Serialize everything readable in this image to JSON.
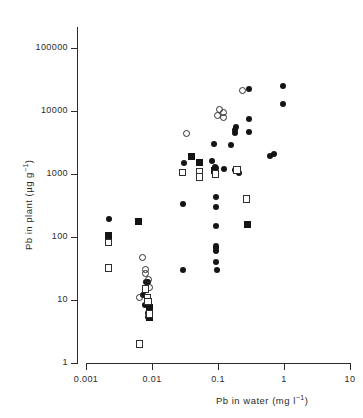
{
  "chart_data": {
    "type": "scatter",
    "title": "",
    "xlabel": "Pb in water (mg l-1)",
    "ylabel": "Pb in plant (µg g-1)",
    "xscale": "log",
    "yscale": "log",
    "xlim": [
      0.001,
      10
    ],
    "ylim": [
      1,
      100000
    ],
    "grid": false,
    "legend": "none",
    "xticks": [
      "0.001",
      "0.01",
      "0.1",
      "1",
      "10"
    ],
    "xtick_values": [
      0.001,
      0.01,
      0.1,
      1,
      10
    ],
    "yticks": [
      "1",
      "10",
      "100",
      "1000",
      "10000",
      "100000"
    ],
    "ytick_values": [
      1,
      10,
      100,
      1000,
      10000,
      100000
    ],
    "series": [
      {
        "name": "filled-circle",
        "marker": "filled-circle",
        "color": "#141414",
        "points": [
          [
            0.0022,
            190
          ],
          [
            0.0072,
            12
          ],
          [
            0.0081,
            19
          ],
          [
            0.0088,
            19
          ],
          [
            0.0079,
            8.4
          ],
          [
            0.0088,
            6.3
          ],
          [
            0.0088,
            5.4
          ],
          [
            0.029,
            330
          ],
          [
            0.031,
            1500
          ],
          [
            0.03,
            30
          ],
          [
            0.082,
            1600
          ],
          [
            0.09,
            1300
          ],
          [
            0.092,
            1250
          ],
          [
            0.088,
            3000
          ],
          [
            0.093,
            430
          ],
          [
            0.093,
            300
          ],
          [
            0.093,
            150
          ],
          [
            0.092,
            72
          ],
          [
            0.093,
            66
          ],
          [
            0.093,
            60
          ],
          [
            0.094,
            40
          ],
          [
            0.095,
            30
          ],
          [
            0.125,
            1200
          ],
          [
            0.155,
            2900
          ],
          [
            0.18,
            1150
          ],
          [
            0.185,
            5500
          ],
          [
            0.183,
            5000
          ],
          [
            0.184,
            4500
          ],
          [
            0.205,
            1050
          ],
          [
            0.3,
            22000
          ],
          [
            0.3,
            7500
          ],
          [
            0.3,
            4700
          ],
          [
            0.62,
            1900
          ],
          [
            0.7,
            2050
          ],
          [
            0.95,
            25000
          ],
          [
            0.98,
            13000
          ]
        ]
      },
      {
        "name": "open-circle",
        "marker": "open-circle",
        "points": [
          [
            0.0072,
            48
          ],
          [
            0.008,
            31
          ],
          [
            0.008,
            26
          ],
          [
            0.009,
            21
          ],
          [
            0.0092,
            16
          ],
          [
            0.0065,
            11
          ],
          [
            0.033,
            4400
          ],
          [
            0.105,
            10500
          ],
          [
            0.12,
            9500
          ],
          [
            0.098,
            8500
          ],
          [
            0.12,
            8000
          ],
          [
            0.235,
            21000
          ]
        ]
      },
      {
        "name": "filled-square",
        "marker": "filled-square",
        "points": [
          [
            0.0022,
            105
          ],
          [
            0.0093,
            7.5
          ],
          [
            0.0093,
            5.2
          ],
          [
            0.0062,
            175
          ],
          [
            0.04,
            1900
          ],
          [
            0.052,
            1500
          ],
          [
            0.09,
            1150
          ],
          [
            0.28,
            160
          ]
        ]
      },
      {
        "name": "open-square",
        "marker": "open-square",
        "points": [
          [
            0.0022,
            82
          ],
          [
            0.0022,
            32
          ],
          [
            0.008,
            15
          ],
          [
            0.0086,
            11
          ],
          [
            0.0087,
            9.5
          ],
          [
            0.0092,
            6.0
          ],
          [
            0.0065,
            2.0
          ],
          [
            0.029,
            1050
          ],
          [
            0.052,
            1100
          ],
          [
            0.052,
            900
          ],
          [
            0.092,
            1000
          ],
          [
            0.193,
            1150
          ],
          [
            0.27,
            400
          ]
        ]
      }
    ]
  },
  "axis_geometry": {
    "x_px_001": 86,
    "x_px_per_decade": 66,
    "y_px_1": 363,
    "y_px_per_decade": 63
  },
  "labels": {
    "y_axis_prefix": "Pb in plant  (",
    "y_axis_unit_base": "µg g",
    "y_axis_unit_exp": "−1",
    "y_axis_suffix": ")",
    "x_axis_prefix": "Pb in water  (mg l",
    "x_axis_unit_exp": "−1",
    "x_axis_suffix": ")"
  }
}
